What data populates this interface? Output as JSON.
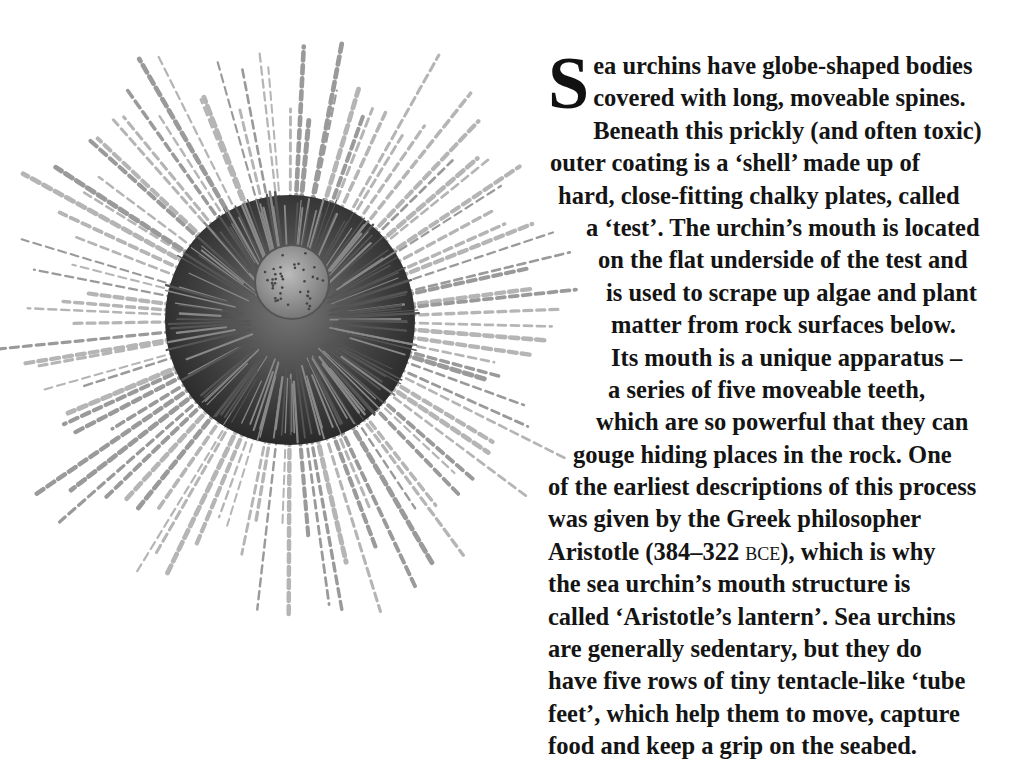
{
  "illustration": {
    "subject": "sea urchin",
    "icon": "sea-urchin-illustration"
  },
  "article": {
    "dropcap": "S",
    "lines": [
      {
        "text": "ea urchins have globe-shaped bodies",
        "indent": 40
      },
      {
        "text": "covered with long, moveable spines.",
        "indent": 40
      },
      {
        "text": "Beneath this prickly (and often toxic)",
        "indent": 2
      },
      {
        "text": "outer coating is a ‘shell’ made up of",
        "indent": 2
      },
      {
        "text": "hard, close-fitting chalky plates, called",
        "indent": 10
      },
      {
        "text": "a ‘test’. The urchin’s mouth is located",
        "indent": 38
      },
      {
        "text": "on the flat underside of the test and",
        "indent": 50
      },
      {
        "text": "is used to scrape up algae and plant",
        "indent": 58
      },
      {
        "text": "matter from rock surfaces below.",
        "indent": 63
      },
      {
        "text": "Its mouth is a unique apparatus –",
        "indent": 63
      },
      {
        "text": "a series of five moveable teeth,",
        "indent": 60
      },
      {
        "text": "which are so powerful that they can",
        "indent": 48
      },
      {
        "text": "gouge hiding places in the rock. One",
        "indent": 25
      },
      {
        "text": "of the earliest descriptions of this process",
        "indent": 0
      },
      {
        "text": "was given by the Greek philosopher",
        "indent": 0
      },
      {
        "text_before": "Aristotle (384–322 ",
        "smallcaps": "BCE",
        "text_after": "), which is why",
        "indent": 0
      },
      {
        "text": "the sea urchin’s mouth structure is",
        "indent": 0
      },
      {
        "text": "called ‘Aristotle’s lantern’. Sea urchins",
        "indent": 0
      },
      {
        "text": "are generally sedentary, but they do",
        "indent": 0
      },
      {
        "text": "have five rows of tiny tentacle-like ‘tube",
        "indent": 0
      },
      {
        "text": "feet’, which help them to move, capture",
        "indent": 0
      },
      {
        "text": "food and keep a grip on the seabed.",
        "indent": 0
      }
    ]
  }
}
